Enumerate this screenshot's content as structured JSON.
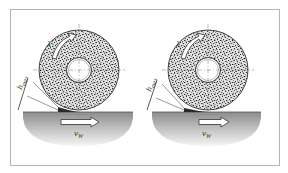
{
  "figure": {
    "panels": [
      {
        "id": "left",
        "wheel": {
          "cx": 79,
          "cy": 70,
          "r_outer": 40,
          "r_hub": 12
        },
        "workpiece": {
          "x1": 23,
          "x2": 133,
          "top": 112,
          "bottom": 146
        },
        "feed_arrow": {
          "x1": 61,
          "x2": 98,
          "y": 122
        },
        "labels": {
          "rotation": "λ",
          "chip_thickness": "h",
          "chip_thickness_sub": "max",
          "feed_velocity": "v",
          "feed_velocity_sub": "W"
        }
      },
      {
        "id": "right",
        "wheel": {
          "cx": 208,
          "cy": 70,
          "r_outer": 40,
          "r_hub": 12
        },
        "workpiece": {
          "x1": 152,
          "x2": 261,
          "top": 112,
          "bottom": 146
        },
        "feed_arrow": {
          "x1": 199,
          "x2": 229,
          "y": 122
        },
        "labels": {
          "rotation": "λ",
          "chip_thickness": "h",
          "chip_thickness_sub": "max",
          "feed_velocity": "v",
          "feed_velocity_sub": "W"
        }
      }
    ],
    "colors": {
      "frame_border": "#b5b5b5",
      "wheel_fill": "#d9d9d9",
      "grain_dark": "#3a3a3a",
      "workpiece_top": "#8c8c8c",
      "workpiece_bottom": "#f2f2f2",
      "arrow_fill": "#ffffff",
      "line": "#333333"
    }
  }
}
